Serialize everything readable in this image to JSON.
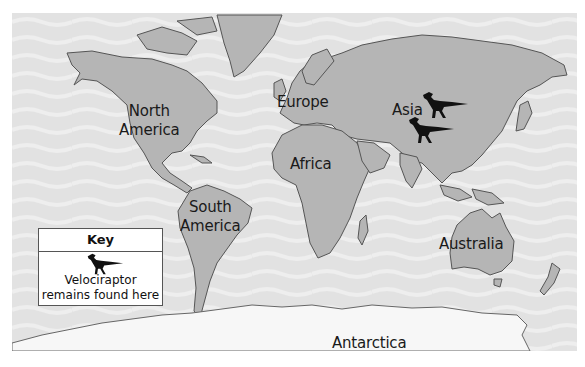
{
  "map": {
    "ocean_color": "#e2e2e2",
    "land_color": "#b5b5b5",
    "antarctica_color": "#f7f7f7",
    "border_color": "#555555"
  },
  "labels": {
    "north_america_line1": "North",
    "north_america_line2": "America",
    "south_america_line1": "South",
    "south_america_line2": "America",
    "europe": "Europe",
    "africa": "Africa",
    "asia": "Asia",
    "australia": "Australia",
    "antarctica": "Antarctica"
  },
  "markers": [
    {
      "icon": "velociraptor-icon",
      "location": "Asia (Mongolia)"
    },
    {
      "icon": "velociraptor-icon",
      "location": "Asia (China)"
    }
  ],
  "key": {
    "title": "Key",
    "icon": "velociraptor-icon",
    "description_line1": "Velociraptor",
    "description_line2": "remains found here"
  }
}
